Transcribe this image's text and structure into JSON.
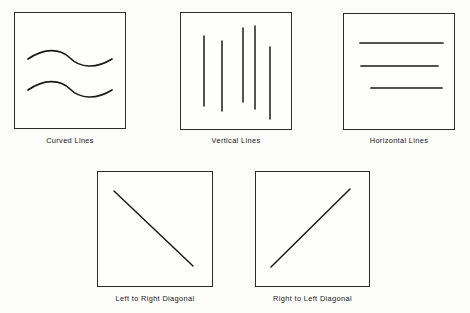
{
  "figure": {
    "background_color": "#fcfcfa",
    "ink_color": "#1a1a1a",
    "border_color": "#2b2b2b",
    "layout": "two-row grid: three panels on top, two panels centered below"
  },
  "panels": [
    {
      "id": "curved-lines",
      "caption": "Curved Lines",
      "box": {
        "x": 14,
        "y": 12,
        "w": 112,
        "h": 117
      },
      "caption_y": 136,
      "art_type": "curved",
      "strokes": [
        {
          "name": "upper-wave",
          "path": "M 14 47 C 30 36, 46 36, 56 46 C 66 56, 82 57, 98 47"
        },
        {
          "name": "lower-wave",
          "path": "M 14 78 C 30 67, 46 67, 56 77 C 66 87, 82 88, 98 78"
        }
      ]
    },
    {
      "id": "vertical-lines",
      "caption": "Vertical Lines",
      "box": {
        "x": 180,
        "y": 12,
        "w": 112,
        "h": 118
      },
      "caption_y": 136,
      "art_type": "vertical",
      "strokes": [
        {
          "name": "line-1",
          "x": 24,
          "y1": 24,
          "y2": 94
        },
        {
          "name": "line-2",
          "x": 42,
          "y1": 29,
          "y2": 99
        },
        {
          "name": "line-3",
          "x": 63,
          "y1": 16,
          "y2": 90
        },
        {
          "name": "line-4",
          "x": 75,
          "y1": 14,
          "y2": 97
        },
        {
          "name": "line-5",
          "x": 90,
          "y1": 35,
          "y2": 107
        }
      ]
    },
    {
      "id": "horizontal-lines",
      "caption": "Horizontal Lines",
      "box": {
        "x": 343,
        "y": 13,
        "w": 112,
        "h": 117
      },
      "caption_y": 136,
      "art_type": "horizontal",
      "strokes": [
        {
          "name": "line-1",
          "y": 30,
          "x1": 17,
          "x2": 100
        },
        {
          "name": "line-2",
          "y": 53,
          "x1": 18,
          "x2": 95
        },
        {
          "name": "line-3",
          "y": 75,
          "x1": 28,
          "x2": 99
        }
      ]
    },
    {
      "id": "left-to-right-diagonal",
      "caption": "Left to Right Diagonal",
      "box": {
        "x": 97,
        "y": 171,
        "w": 116,
        "h": 116
      },
      "caption_y": 294,
      "art_type": "diagonal",
      "strokes": [
        {
          "name": "diagonal-down",
          "x1": 17,
          "y1": 20,
          "x2": 96,
          "y2": 95
        }
      ]
    },
    {
      "id": "right-to-left-diagonal",
      "caption": "Right to Left Diagonal",
      "box": {
        "x": 255,
        "y": 171,
        "w": 115,
        "h": 116
      },
      "caption_y": 294,
      "art_type": "diagonal",
      "strokes": [
        {
          "name": "diagonal-up",
          "x1": 16,
          "y1": 96,
          "x2": 95,
          "y2": 18
        }
      ]
    }
  ]
}
